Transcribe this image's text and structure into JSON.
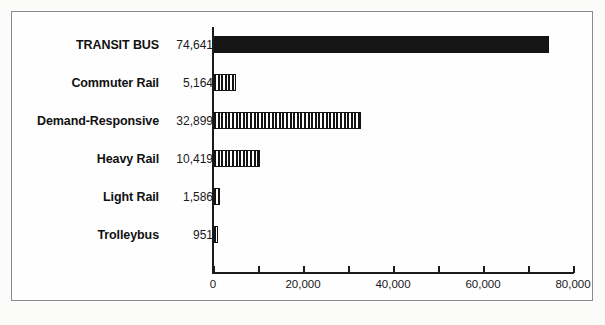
{
  "chart_data": {
    "type": "bar",
    "orientation": "horizontal",
    "title": "",
    "xlabel": "",
    "ylabel": "",
    "xlim": [
      0,
      80000
    ],
    "grid": false,
    "legend": null,
    "categories": [
      "TRANSIT BUS",
      "Commuter Rail",
      "Demand-Responsive",
      "Heavy Rail",
      "Light Rail",
      "Trolleybus"
    ],
    "values": [
      74641,
      5164,
      32899,
      10419,
      1586,
      951
    ],
    "value_labels": [
      "74,641",
      "5,164",
      "32,899",
      "10,419",
      "1,586",
      "951"
    ],
    "fills": [
      "solid",
      "striped",
      "striped",
      "striped",
      "striped",
      "striped"
    ],
    "xticks": [
      0,
      10000,
      20000,
      30000,
      40000,
      50000,
      60000,
      70000,
      80000
    ],
    "xtick_labels": [
      "0",
      "",
      "20,000",
      "",
      "40,000",
      "",
      "60,000",
      "",
      "80,000"
    ]
  },
  "style": {
    "bar_fill_color": "#151515",
    "bar_edge_color": "#121212",
    "axis_color": "#1b1b1b",
    "frame_color": "#8a8a8a",
    "background": "#fbfbfa",
    "text_color": "#111111"
  }
}
